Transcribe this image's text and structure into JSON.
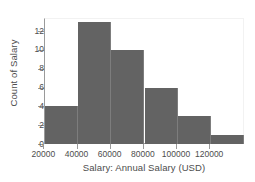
{
  "chart_data": {
    "type": "bar",
    "subtype": "histogram",
    "title": "",
    "xlabel": "Salary: Annual Salary (USD)",
    "ylabel": "Count of Salary",
    "xlim": [
      21000,
      141000
    ],
    "ylim": [
      0,
      13.4
    ],
    "grid": false,
    "legend": null,
    "bar_color": "#636363",
    "bin_width": 20000,
    "bin_edges": [
      21000,
      41000,
      61000,
      81000,
      101000,
      121000,
      141000
    ],
    "categories": [
      "21000-41000",
      "41000-61000",
      "61000-81000",
      "81000-101000",
      "101000-121000",
      "121000-141000"
    ],
    "values": [
      4,
      13,
      10,
      6,
      3,
      1
    ],
    "xticks": [
      20000,
      40000,
      60000,
      80000,
      100000,
      120000
    ],
    "xticklabels": [
      "20000",
      "40000",
      "60000",
      "80000",
      "100000",
      "120000"
    ],
    "yticks": [
      0,
      2,
      4,
      6,
      8,
      10,
      12
    ],
    "yticklabels": [
      "0",
      "2",
      "4",
      "6",
      "8",
      "10",
      "12"
    ]
  },
  "axes": {
    "x_title": "Salary: Annual Salary (USD)",
    "y_title": "Count of Salary"
  }
}
